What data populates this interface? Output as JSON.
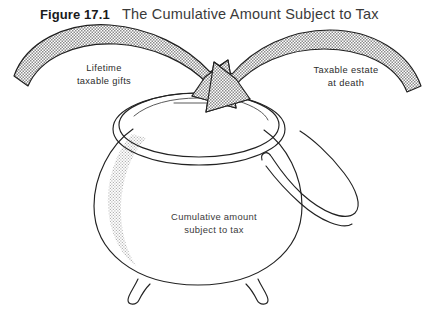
{
  "figure": {
    "number_label": "Figure 17.1",
    "title": "The Cumulative Amount Subject to Tax",
    "background_color": "#ffffff",
    "ink_color": "#222222",
    "stipple_color": "#9a9a9a"
  },
  "annotations": {
    "left_arrow_label_line1": "Lifetime",
    "left_arrow_label_line2": "taxable gifts",
    "right_arrow_label_line1": "Taxable estate",
    "right_arrow_label_line2": "at death",
    "pot_label_line1": "Cumulative amount",
    "pot_label_line2": "subject to tax"
  },
  "diagram": {
    "type": "conceptual-illustration",
    "inflows": [
      {
        "name": "lifetime-taxable-gifts",
        "direction": "left-to-center-down"
      },
      {
        "name": "taxable-estate-at-death",
        "direction": "right-to-center-down"
      }
    ],
    "container": {
      "name": "cumulative-amount-subject-to-tax",
      "parts": [
        "rim",
        "body",
        "handle",
        "legs"
      ]
    }
  }
}
